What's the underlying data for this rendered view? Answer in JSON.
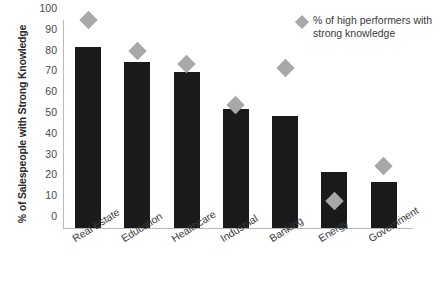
{
  "chart_data": {
    "type": "bar",
    "title": "",
    "xlabel": "",
    "ylabel": "% of Salespeople with Strong Knowledge",
    "ylim": [
      0,
      100
    ],
    "yticks": [
      0,
      10,
      20,
      30,
      40,
      50,
      60,
      70,
      80,
      90,
      100
    ],
    "grid": false,
    "legend_position": "top-right",
    "categories": [
      "Real Estate",
      "Education",
      "Healthcare",
      "Industrial",
      "Banking",
      "Energy",
      "Government"
    ],
    "series": [
      {
        "name": "% of Salespeople with Strong Knowledge",
        "type": "bar",
        "color": "#1a1a1a",
        "values": [
          87,
          80,
          75,
          57,
          54,
          27,
          22
        ]
      },
      {
        "name": "% of high performers with strong knowledge",
        "type": "marker",
        "marker": "diamond",
        "color": "#a8a8a8",
        "values": [
          100,
          85,
          79,
          59,
          77,
          13,
          30
        ]
      }
    ]
  },
  "legend": {
    "marker_name": "diamond-marker-icon",
    "label": "% of high performers with strong knowledge"
  },
  "axes": {
    "y_title": "% of Salespeople with Strong Knowledge"
  }
}
